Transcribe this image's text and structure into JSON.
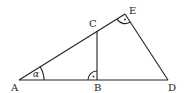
{
  "diagram": {
    "points": {
      "A": {
        "label": "A",
        "x": 19,
        "y": 80
      },
      "B": {
        "label": "B",
        "x": 97,
        "y": 80
      },
      "C": {
        "label": "C",
        "x": 97,
        "y": 31
      },
      "D": {
        "label": "D",
        "x": 168,
        "y": 80
      },
      "E": {
        "label": "E",
        "x": 125,
        "y": 14
      }
    },
    "segments": [
      "AD",
      "AE",
      "ED",
      "BC"
    ],
    "angle_label": "α",
    "right_angles": [
      "B",
      "E"
    ],
    "stroke_color": "#222222"
  }
}
